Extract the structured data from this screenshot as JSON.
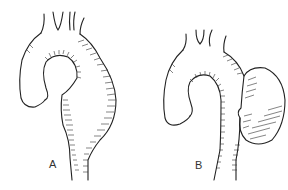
{
  "figure": {
    "panels": [
      {
        "label": "A",
        "depiction": "aortic-arch-fusiform-aneurysm"
      },
      {
        "label": "B",
        "depiction": "aortic-arch-saccular-aneurysm"
      }
    ],
    "colors": {
      "background": "#ffffff",
      "ink": "#222222"
    }
  }
}
